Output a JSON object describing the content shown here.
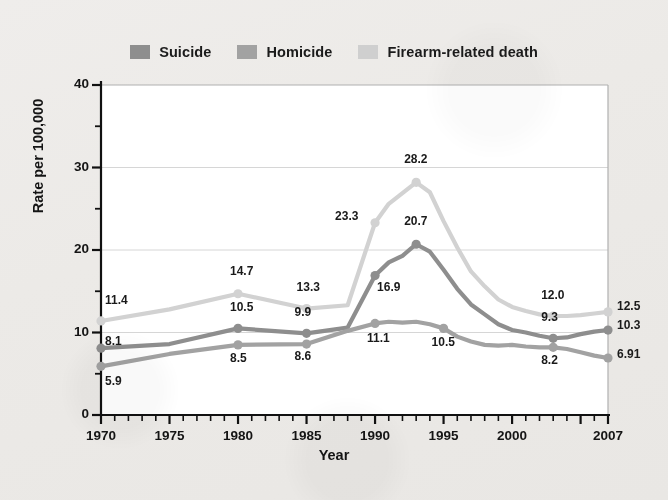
{
  "figure": {
    "background_color": "#ecebe8",
    "plot_background_color": "#ffffff",
    "plot_border_color": "#a8a8a8"
  },
  "legend": {
    "position": "top-center",
    "entries": [
      {
        "label": "Suicide",
        "color": "#8e8e8e",
        "swatch": "legend-swatch-suicide"
      },
      {
        "label": "Homicide",
        "color": "#a2a2a2",
        "swatch": "legend-swatch-homicide"
      },
      {
        "label": "Firearm-related death",
        "color": "#cfcfcf",
        "swatch": "legend-swatch-firearm"
      }
    ]
  },
  "axes": {
    "y": {
      "title": "Rate per 100,000",
      "ticks": [
        "0",
        "10",
        "20",
        "30",
        "40"
      ],
      "min": 0,
      "max": 40,
      "minor_step": 5,
      "gridlines": true
    },
    "x": {
      "title": "Year",
      "ticks": [
        "1970",
        "1975",
        "1980",
        "1985",
        "1990",
        "1995",
        "2000",
        "2007"
      ],
      "min": 1970,
      "max": 2007,
      "minor_step": 1,
      "gridlines": false
    }
  },
  "chart_data": {
    "type": "line",
    "title": "",
    "subtitle": "",
    "xlabel": "Year",
    "ylabel": "Rate per 100,000",
    "xlim": [
      1970,
      2007
    ],
    "ylim": [
      0,
      40
    ],
    "grid": "horizontal-major",
    "legend_position": "top-center",
    "x": [
      1970,
      1975,
      1980,
      1985,
      1988,
      1990,
      1991,
      1992,
      1993,
      1994,
      1995,
      1996,
      1997,
      1998,
      1999,
      2000,
      2001,
      2002,
      2003,
      2004,
      2005,
      2006,
      2007
    ],
    "series": [
      {
        "name": "Suicide",
        "color": "#8e8e8e",
        "values": [
          8.1,
          8.6,
          10.5,
          9.9,
          10.6,
          16.9,
          18.5,
          19.3,
          20.7,
          19.8,
          17.6,
          15.3,
          13.4,
          12.2,
          11.0,
          10.3,
          10.0,
          9.6,
          9.3,
          9.4,
          9.8,
          10.1,
          10.3
        ]
      },
      {
        "name": "Homicide",
        "color": "#a2a2a2",
        "values": [
          5.9,
          7.4,
          8.5,
          8.6,
          10.2,
          11.1,
          11.3,
          11.2,
          11.3,
          11.0,
          10.5,
          9.5,
          8.9,
          8.5,
          8.4,
          8.5,
          8.3,
          8.2,
          8.2,
          8.0,
          7.6,
          7.2,
          6.91
        ]
      },
      {
        "name": "Firearm-related death",
        "color": "#d2d2d2",
        "values": [
          11.4,
          12.8,
          14.7,
          12.9,
          13.3,
          23.3,
          25.6,
          26.9,
          28.2,
          27.0,
          23.5,
          20.3,
          17.4,
          15.6,
          14.0,
          13.1,
          12.6,
          12.2,
          12.0,
          12.0,
          12.1,
          12.3,
          12.5
        ]
      }
    ],
    "point_labels": [
      {
        "series": "Firearm-related death",
        "year": 1970,
        "text": "11.4"
      },
      {
        "series": "Suicide",
        "year": 1970,
        "text": "8.1"
      },
      {
        "series": "Homicide",
        "year": 1970,
        "text": "5.9"
      },
      {
        "series": "Firearm-related death",
        "year": 1980,
        "text": "14.7"
      },
      {
        "series": "Suicide",
        "year": 1980,
        "text": "10.5"
      },
      {
        "series": "Homicide",
        "year": 1980,
        "text": "8.5"
      },
      {
        "series": "Firearm-related death",
        "year": 1985,
        "text": "13.3"
      },
      {
        "series": "Suicide",
        "year": 1985,
        "text": "9.9"
      },
      {
        "series": "Homicide",
        "year": 1985,
        "text": "8.6"
      },
      {
        "series": "Firearm-related death",
        "year": 1990,
        "text": "23.3"
      },
      {
        "series": "Suicide",
        "year": 1990,
        "text": "16.9"
      },
      {
        "series": "Homicide",
        "year": 1990,
        "text": "11.1"
      },
      {
        "series": "Firearm-related death",
        "year": 1993,
        "text": "28.2"
      },
      {
        "series": "Suicide",
        "year": 1993,
        "text": "20.7"
      },
      {
        "series": "Homicide",
        "year": 1995,
        "text": "10.5"
      },
      {
        "series": "Firearm-related death",
        "year": 2003,
        "text": "12.0"
      },
      {
        "series": "Suicide",
        "year": 2003,
        "text": "9.3"
      },
      {
        "series": "Homicide",
        "year": 2003,
        "text": "8.2"
      },
      {
        "series": "Firearm-related death",
        "year": 2007,
        "text": "12.5"
      },
      {
        "series": "Suicide",
        "year": 2007,
        "text": "10.3"
      },
      {
        "series": "Homicide",
        "year": 2007,
        "text": "6.91"
      }
    ]
  }
}
